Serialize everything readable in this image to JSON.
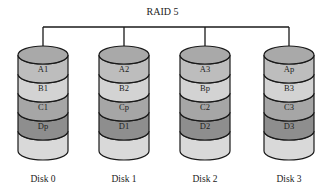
{
  "diagram": {
    "title": "RAID 5",
    "colors": {
      "line": "#1a1a1a",
      "top": "#a9a9a9",
      "row1": "#bdbdbd",
      "row2": "#d3d3d3",
      "row3": "#a6a6a6",
      "row4": "#8e8e8e",
      "bottom": "#d9d9d9"
    },
    "disks": [
      {
        "label": "Disk 0",
        "blocks": [
          "A1",
          "B1",
          "C1",
          "Dp"
        ]
      },
      {
        "label": "Disk 1",
        "blocks": [
          "A2",
          "B2",
          "Cp",
          "D1"
        ]
      },
      {
        "label": "Disk 2",
        "blocks": [
          "A3",
          "Bp",
          "C2",
          "D2"
        ]
      },
      {
        "label": "Disk 3",
        "blocks": [
          "Ap",
          "B3",
          "C3",
          "D3"
        ]
      }
    ]
  }
}
